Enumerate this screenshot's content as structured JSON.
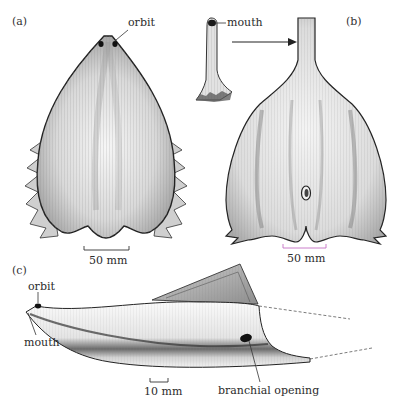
{
  "figure": {
    "panels": [
      {
        "id": "a",
        "panel_label": "(a)",
        "annotations": [
          {
            "text": "orbit",
            "target": "orbit"
          }
        ],
        "scale_bar": {
          "label": "50 mm",
          "color": "#333333"
        }
      },
      {
        "id": "b",
        "panel_label": "(b)",
        "annotations": [
          {
            "text": "mouth",
            "target": "mouth tube"
          }
        ],
        "scale_bar": {
          "label": "50 mm",
          "color": "#c46fc4"
        }
      },
      {
        "id": "c",
        "panel_label": "(c)",
        "annotations": [
          {
            "text": "orbit",
            "target": "orbit"
          },
          {
            "text": "mouth",
            "target": "mouth"
          },
          {
            "text": "branchial opening",
            "target": "branchial opening"
          }
        ],
        "scale_bar": {
          "label": "10 mm",
          "color": "#333333"
        }
      }
    ]
  },
  "colors": {
    "ink": "#2a2a2a",
    "shade": "#6e6e6e",
    "fill": "#e9e9e9",
    "magenta_scale": "#c46fc4"
  }
}
